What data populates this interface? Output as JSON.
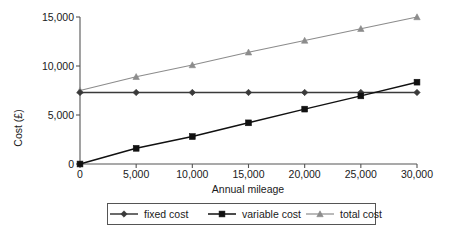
{
  "chart_data": {
    "type": "line",
    "title": "",
    "xlabel": "Annual mileage",
    "ylabel": "Cost (£)",
    "x": [
      0,
      5000,
      10000,
      15000,
      20000,
      25000,
      30000
    ],
    "xtick_labels": [
      "0",
      "5,000",
      "10,000",
      "15,000",
      "20,000",
      "25,000",
      "30,000"
    ],
    "ytick_values": [
      0,
      5000,
      10000,
      15000
    ],
    "ytick_labels": [
      "0",
      "5,000",
      "10,000",
      "15,000"
    ],
    "xlim": [
      0,
      30000
    ],
    "ylim": [
      0,
      15000
    ],
    "grid": false,
    "legend_position": "bottom",
    "series": [
      {
        "name": "fixed cost",
        "marker": "diamond",
        "color": "#3a3a3a",
        "values": [
          7300,
          7300,
          7300,
          7300,
          7300,
          7300,
          7300
        ]
      },
      {
        "name": "variable cost",
        "marker": "square",
        "color": "#111111",
        "values": [
          0,
          1600,
          2800,
          4200,
          5600,
          6950,
          8350
        ]
      },
      {
        "name": "total cost",
        "marker": "triangle",
        "color": "#8c8c8c",
        "values": [
          7500,
          8900,
          10100,
          11400,
          12600,
          13800,
          15000
        ]
      }
    ]
  },
  "legend": {
    "items": [
      {
        "label": "fixed cost"
      },
      {
        "label": "variable cost"
      },
      {
        "label": "total cost"
      }
    ]
  },
  "axes": {
    "x_title": "Annual mileage",
    "y_title": "Cost (£)"
  },
  "colors": {
    "axis": "#555555",
    "fixed_cost": "#3a3a3a",
    "variable_cost": "#111111",
    "total_cost": "#8c8c8c",
    "background": "#ffffff",
    "text": "#1a1a1a"
  }
}
